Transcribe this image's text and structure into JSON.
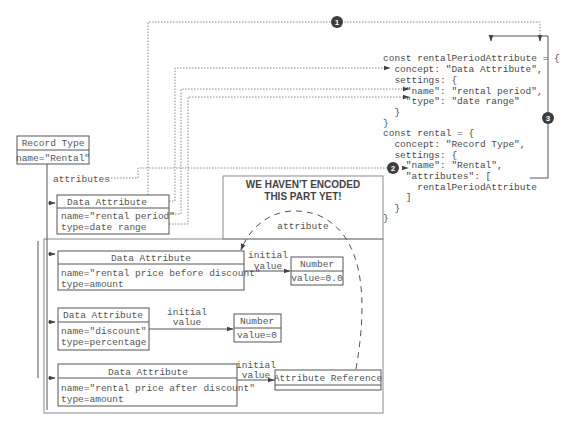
{
  "diagram": {
    "record_type": {
      "title": "Record Type",
      "name": "name=\"Rental\""
    },
    "attributes_label": "attributes",
    "rental_period_attr": {
      "title": "Data Attribute",
      "name": "name=\"rental period\"",
      "type": "type=date range"
    },
    "not_encoded": {
      "line1": "WE HAVEN'T ENCODED",
      "line2": "THIS PART YET!",
      "attribute_label": "attribute"
    },
    "price_before_attr": {
      "title": "Data Attribute",
      "name": "name=\"rental price before discount\"",
      "type": "type=amount"
    },
    "discount_attr": {
      "title": "Data Attribute",
      "name": "name=\"discount\"",
      "type": "type=percentage"
    },
    "price_after_attr": {
      "title": "Data Attribute",
      "name": "name=\"rental price after discount\"",
      "type": "type=amount"
    },
    "number_1": {
      "title": "Number",
      "value": "value=0.0"
    },
    "number_2": {
      "title": "Number",
      "value": "value=0"
    },
    "attribute_reference": {
      "title": "Attribute Reference"
    },
    "initial_value_1": {
      "line1": "initial",
      "line2": "value"
    },
    "initial_value_2": {
      "line1": "initial",
      "line2": "value"
    },
    "initial_value_3": {
      "line1": "initial",
      "line2": "value"
    },
    "badges": [
      "1",
      "2",
      "3"
    ],
    "code": [
      "const rentalPeriodAttribute = {",
      "  concept: \"Data Attribute\",",
      "  settings: {",
      "    \"name\": \"rental period\",",
      "    \"type\": \"date range\"",
      "  }",
      "}",
      "const rental = {",
      "  concept: \"Record Type\",",
      "  settings: {",
      "    \"name\": \"Rental\",",
      "    \"attributes\": [",
      "      rentalPeriodAttribute",
      "    ]",
      "  }",
      "}"
    ]
  }
}
